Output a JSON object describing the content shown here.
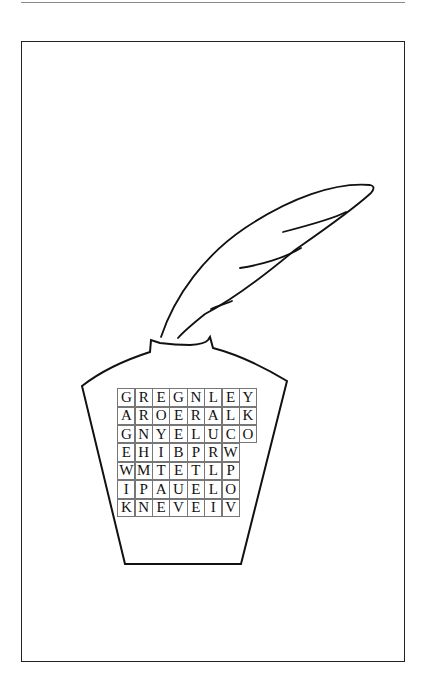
{
  "puzzle": {
    "type": "word-search",
    "illustration": "quill-in-inkpot",
    "grid": [
      [
        "G",
        "R",
        "E",
        "G",
        "N",
        "L",
        "E",
        "Y"
      ],
      [
        "A",
        "R",
        "O",
        "E",
        "R",
        "A",
        "L",
        "K"
      ],
      [
        "G",
        "N",
        "Y",
        "E",
        "L",
        "U",
        "C",
        "O"
      ],
      [
        "E",
        "H",
        "I",
        "B",
        "P",
        "R",
        "W"
      ],
      [
        "W",
        "M",
        "T",
        "E",
        "T",
        "L",
        "P"
      ],
      [
        "I",
        "P",
        "A",
        "U",
        "E",
        "L",
        "O"
      ],
      [
        "K",
        "N",
        "E",
        "V",
        "E",
        "I",
        "V"
      ]
    ]
  },
  "colors": {
    "ink": "#111111",
    "grid_line": "#777777",
    "rule": "#8a8a8a",
    "background": "#ffffff"
  }
}
